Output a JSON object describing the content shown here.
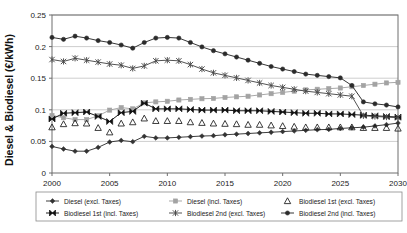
{
  "chart_data": {
    "type": "line",
    "title": "",
    "xlabel": "",
    "ylabel": "Diesel & Biodiesel (€/kWh)",
    "xlim": [
      2000,
      2030
    ],
    "ylim": [
      0,
      0.25
    ],
    "xticks": [
      2000,
      2005,
      2010,
      2015,
      2020,
      2025,
      2030
    ],
    "yticks": [
      0,
      0.05,
      0.1,
      0.15,
      0.2,
      0.25
    ],
    "ytick_labels": [
      "0",
      "0.05",
      "0.1",
      "0.15",
      "0.2",
      "0.25"
    ],
    "xtick_labels": [
      "2000",
      "2005",
      "2010",
      "2015",
      "2020",
      "2025",
      "2030"
    ],
    "grid": "horizontal",
    "legend_position": "bottom",
    "x": [
      2000,
      2001,
      2002,
      2003,
      2004,
      2005,
      2006,
      2007,
      2008,
      2009,
      2010,
      2011,
      2012,
      2013,
      2014,
      2015,
      2016,
      2017,
      2018,
      2019,
      2020,
      2021,
      2022,
      2023,
      2024,
      2025,
      2026,
      2027,
      2028,
      2029,
      2030
    ],
    "series": [
      {
        "name": "Diesel (excl. Taxes)",
        "marker": "diamond",
        "color": "#333333",
        "values": [
          0.042,
          0.038,
          0.0345,
          0.0345,
          0.0405,
          0.049,
          0.0515,
          0.0495,
          0.058,
          0.0555,
          0.0555,
          0.0565,
          0.0575,
          0.0585,
          0.059,
          0.0605,
          0.0615,
          0.0625,
          0.0635,
          0.0645,
          0.0655,
          0.0665,
          0.0675,
          0.0685,
          0.069,
          0.0705,
          0.0715,
          0.0725,
          0.0745,
          0.0765,
          0.079
        ]
      },
      {
        "name": "Diesel (incl. Taxes)",
        "marker": "square",
        "color": "#a3a3a3",
        "values": [
          0.091,
          0.0875,
          0.0845,
          0.0845,
          0.0905,
          0.0995,
          0.1035,
          0.1015,
          0.111,
          0.1125,
          0.1135,
          0.1155,
          0.1165,
          0.1175,
          0.118,
          0.1195,
          0.1205,
          0.1215,
          0.1235,
          0.1255,
          0.1275,
          0.1295,
          0.1315,
          0.1325,
          0.1335,
          0.1345,
          0.1365,
          0.1385,
          0.1405,
          0.1425,
          0.1435
        ]
      },
      {
        "name": "Biodiesel 1st (excl. Taxes)",
        "marker": "triangle",
        "color": "#1a1a1a",
        "values": [
          0.0725,
          0.0775,
          0.079,
          0.0785,
          0.0715,
          0.0645,
          0.0785,
          0.0805,
          0.0865,
          0.0825,
          0.0825,
          0.0825,
          0.0805,
          0.0795,
          0.0785,
          0.078,
          0.0775,
          0.0765,
          0.0765,
          0.0755,
          0.0745,
          0.0735,
          0.0725,
          0.0725,
          0.0725,
          0.0725,
          0.0725,
          0.0715,
          0.0715,
          0.0715,
          0.0705
        ]
      },
      {
        "name": "Biodiesel 1st (incl. Taxes)",
        "marker": "bowtie",
        "color": "#111111",
        "values": [
          0.0855,
          0.0945,
          0.0955,
          0.0965,
          0.0895,
          0.0815,
          0.0955,
          0.0975,
          0.1105,
          0.1015,
          0.1015,
          0.1015,
          0.1005,
          0.0995,
          0.0995,
          0.0995,
          0.0985,
          0.0985,
          0.0985,
          0.0975,
          0.0965,
          0.0955,
          0.0945,
          0.0945,
          0.0935,
          0.0935,
          0.0925,
          0.0915,
          0.0905,
          0.0895,
          0.0885
        ]
      },
      {
        "name": "Biodiesel 2nd (excl. Taxes)",
        "marker": "asterisk",
        "color": "#4a4a4a",
        "values": [
          0.1795,
          0.1765,
          0.1815,
          0.1785,
          0.1755,
          0.1725,
          0.1705,
          0.1655,
          0.1695,
          0.1775,
          0.1785,
          0.1775,
          0.1715,
          0.1645,
          0.1585,
          0.1545,
          0.1505,
          0.1465,
          0.1425,
          0.1385,
          0.1355,
          0.1325,
          0.1295,
          0.1275,
          0.1255,
          0.1235,
          0.1215,
          0.0905,
          0.0895,
          0.0885,
          0.0875
        ]
      },
      {
        "name": "Biodiesel 2nd (incl. Taxes)",
        "marker": "circle",
        "color": "#2b2b2b",
        "values": [
          0.2145,
          0.2115,
          0.2165,
          0.2135,
          0.2095,
          0.2065,
          0.2025,
          0.1975,
          0.2065,
          0.2135,
          0.2145,
          0.2135,
          0.2065,
          0.1995,
          0.1935,
          0.1885,
          0.1835,
          0.1785,
          0.1735,
          0.1685,
          0.1645,
          0.1605,
          0.1565,
          0.1545,
          0.1525,
          0.1505,
          0.1385,
          0.1125,
          0.1095,
          0.1075,
          0.1045
        ]
      }
    ],
    "legend": [
      "Diesel (excl. Taxes)",
      "Diesel (incl. Taxes)",
      "Biodiesel 1st (excl. Taxes)",
      "Biodiesel 1st (incl. Taxes)",
      "Biodiesel 2nd (excl. Taxes)",
      "Biodiesel 2nd (incl. Taxes)"
    ]
  }
}
